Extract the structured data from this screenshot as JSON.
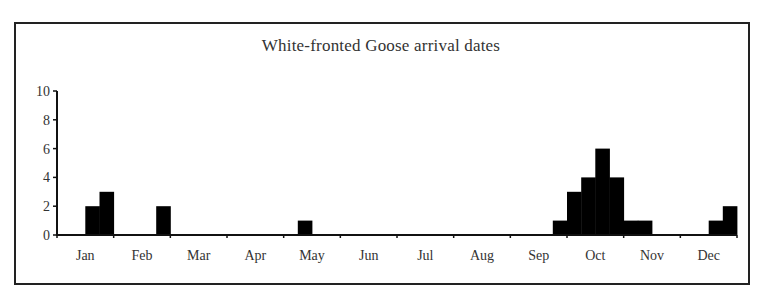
{
  "chart_data": {
    "type": "bar",
    "title": "White-fronted Goose arrival dates",
    "xlabel": "",
    "ylabel": "",
    "ylim": [
      0,
      10
    ],
    "yticks": [
      0,
      2,
      4,
      6,
      8,
      10
    ],
    "grid": false,
    "legend": null,
    "months": [
      "Jan",
      "Feb",
      "Mar",
      "Apr",
      "May",
      "Jun",
      "Jul",
      "Aug",
      "Sep",
      "Oct",
      "Nov",
      "Dec"
    ],
    "bin_unit": "quarter-month (4 bins per month)",
    "bins": [
      {
        "month": "Jan",
        "bin": 2,
        "value": 2
      },
      {
        "month": "Jan",
        "bin": 3,
        "value": 3
      },
      {
        "month": "Feb",
        "bin": 3,
        "value": 2
      },
      {
        "month": "May",
        "bin": 1,
        "value": 1
      },
      {
        "month": "Sep",
        "bin": 3,
        "value": 1
      },
      {
        "month": "Oct",
        "bin": 0,
        "value": 3
      },
      {
        "month": "Oct",
        "bin": 1,
        "value": 4
      },
      {
        "month": "Oct",
        "bin": 2,
        "value": 6
      },
      {
        "month": "Oct",
        "bin": 3,
        "value": 4
      },
      {
        "month": "Nov",
        "bin": 0,
        "value": 1
      },
      {
        "month": "Nov",
        "bin": 1,
        "value": 1
      },
      {
        "month": "Dec",
        "bin": 2,
        "value": 1
      },
      {
        "month": "Dec",
        "bin": 3,
        "value": 2
      }
    ],
    "bar_color": "#000000"
  }
}
